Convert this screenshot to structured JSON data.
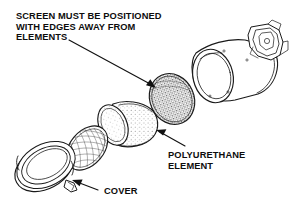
{
  "figure": {
    "background_color": "#ffffff",
    "line_color": "#1a1a1a",
    "text_color": "#0d0d0d",
    "width": 291,
    "height": 207
  },
  "callouts": {
    "screen_note": {
      "lines": [
        "SCREEN MUST BE POSITIONED",
        "WITH EDGES AWAY FROM",
        "ELEMENTS"
      ],
      "line1": "SCREEN MUST BE POSITIONED",
      "line2": "WITH EDGES AWAY FROM",
      "line3": "ELEMENTS",
      "points_to": "screen-disc"
    },
    "polyurethane": {
      "lines": [
        "POLYURETHANE",
        "ELEMENT"
      ],
      "line1": "POLYURETHANE",
      "line2": "ELEMENT",
      "points_to": "polyurethane-element"
    },
    "cover": {
      "lines": [
        "COVER"
      ],
      "line1": "COVER",
      "points_to": "cover-ring"
    }
  },
  "parts": [
    {
      "id": "housing",
      "name": "air-cleaner-housing",
      "description": "cylindrical canister body with mounting bracket"
    },
    {
      "id": "bracket",
      "name": "mounting-bracket",
      "description": "angular clamp fitting at housing rear"
    },
    {
      "id": "screen-disc",
      "name": "screen-disc",
      "description": "stippled mesh screen disc"
    },
    {
      "id": "polyurethane-element",
      "name": "polyurethane-element",
      "description": "short stippled foam cylinder sleeve"
    },
    {
      "id": "filter-element",
      "name": "filter-element",
      "description": "oval cross-hatched mesh filter element"
    },
    {
      "id": "cover-ring",
      "name": "cover-ring",
      "description": "ring shaped end cover with latch tab"
    }
  ]
}
